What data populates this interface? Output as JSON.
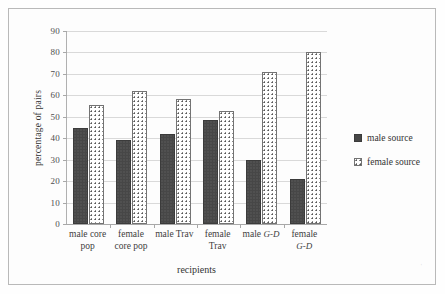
{
  "chart_data": {
    "type": "bar",
    "title": "",
    "xlabel": "recipients",
    "ylabel": "percentage of pairs",
    "ylim": [
      0,
      90
    ],
    "ytick_step": 10,
    "yticks": [
      0,
      10,
      20,
      30,
      40,
      50,
      60,
      70,
      80,
      90
    ],
    "grid": true,
    "legend_position": "right",
    "categories": [
      "male core pop",
      "female core pop",
      "male Trav",
      "female Trav",
      "male G-D",
      "female G-D"
    ],
    "category_lines": [
      [
        "male core",
        "pop"
      ],
      [
        "female",
        "core pop"
      ],
      [
        "male Trav",
        ""
      ],
      [
        "female",
        "Trav"
      ],
      [
        "male ",
        "G-D"
      ],
      [
        "female",
        "G-D"
      ]
    ],
    "series": [
      {
        "name": "male source",
        "values": [
          45,
          39,
          42,
          48.5,
          30,
          21
        ]
      },
      {
        "name": "female source",
        "values": [
          55.5,
          62,
          58.5,
          52.5,
          71,
          80
        ]
      }
    ]
  },
  "axes": {
    "y_title": "percentage of pairs",
    "x_title": "recipients",
    "y_tick_labels": [
      "90",
      "80",
      "70",
      "60",
      "50",
      "40",
      "30",
      "20",
      "10",
      "0"
    ]
  },
  "legend": {
    "items": [
      {
        "label": "male source",
        "swatch": "filled-dark-square"
      },
      {
        "label": "female source",
        "swatch": "dotted-white-square"
      }
    ]
  },
  "xcategories": [
    {
      "line1": "male core",
      "line2": "pop",
      "italic2": false,
      "italic_tail": ""
    },
    {
      "line1": "female",
      "line2": "core pop",
      "italic2": false,
      "italic_tail": ""
    },
    {
      "line1": "male Trav",
      "line2": "",
      "italic2": false,
      "italic_tail": ""
    },
    {
      "line1": "female",
      "line2": "Trav",
      "italic2": false,
      "italic_tail": ""
    },
    {
      "line1": "male ",
      "line2": "",
      "italic2": false,
      "italic_tail": "G-D"
    },
    {
      "line1": "female",
      "line2": "",
      "italic2": true,
      "italic_tail": "G-D"
    }
  ],
  "colors": {
    "male_bar": "#474747",
    "female_bar_fill": "#ffffff",
    "female_bar_dots": "#555555",
    "gridline": "#d9d9d9",
    "axis": "#a8a8a8",
    "frame": "#b9b9b9",
    "text": "#333333",
    "background": "#fdfdfd"
  },
  "artifact": {
    "mark": "ˌ"
  }
}
